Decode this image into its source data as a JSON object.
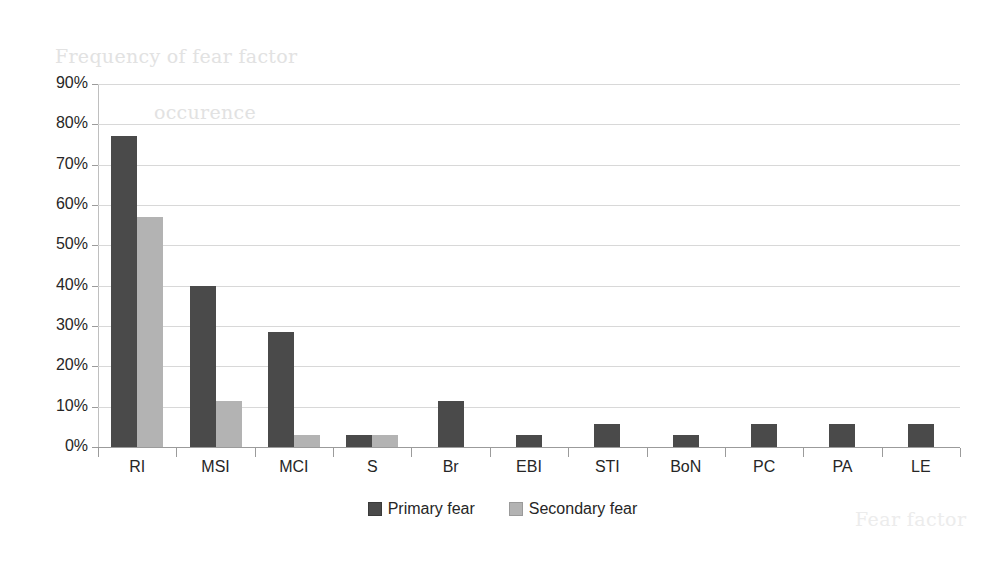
{
  "chart_data": {
    "type": "bar",
    "title": "Frequency of fear factor occurence",
    "title_line1": "Frequency of fear factor",
    "title_line2": "occurence",
    "xlabel": "Fear factor",
    "ylabel": "",
    "ylim": [
      0,
      90
    ],
    "ytick_labels": [
      "90%",
      "80%",
      "70%",
      "60%",
      "50%",
      "40%",
      "30%",
      "20%",
      "10%",
      "0%"
    ],
    "ytick_values": [
      90,
      80,
      70,
      60,
      50,
      40,
      30,
      20,
      10,
      0
    ],
    "grid": true,
    "legend_position": "bottom-center",
    "categories": [
      "RI",
      "MSI",
      "MCI",
      "S",
      "Br",
      "EBI",
      "STI",
      "BoN",
      "PC",
      "PA",
      "LE"
    ],
    "series": [
      {
        "name": "Primary fear",
        "color": "#4a4a4a",
        "values": [
          77.1,
          40.0,
          28.6,
          2.9,
          11.4,
          2.9,
          5.7,
          2.9,
          5.7,
          5.7,
          5.7
        ]
      },
      {
        "name": "Secondary fear",
        "color": "#b3b3b3",
        "values": [
          57.1,
          11.4,
          2.9,
          2.9,
          0,
          0,
          0,
          0,
          0,
          0,
          0
        ]
      }
    ]
  },
  "legend": {
    "entries": [
      {
        "label": "Primary fear",
        "swatch": "primary"
      },
      {
        "label": "Secondary fear",
        "swatch": "secondary"
      }
    ]
  },
  "colors": {
    "primary_bar": "#4a4a4a",
    "secondary_bar": "#b3b3b3",
    "gridline": "#d8d8d8",
    "axis": "#9b9b9b",
    "title_text": "#e2e2e2",
    "tick_text": "#262626"
  }
}
